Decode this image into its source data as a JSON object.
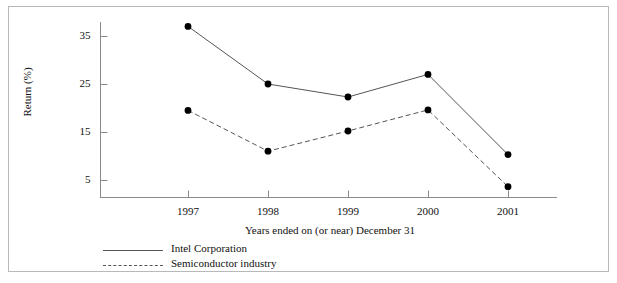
{
  "chart_data": {
    "type": "line",
    "title": "",
    "subtitle": "",
    "xlabel": "Years ended on (or near) December 31",
    "ylabel": "Return (%)",
    "categories": [
      "1997",
      "1998",
      "1999",
      "2000",
      "2001"
    ],
    "xtick_labels": [
      "1997",
      "1998",
      "1999",
      "2000",
      "2001"
    ],
    "ytick_labels": [
      "5",
      "15",
      "25",
      "35"
    ],
    "yticks": [
      5,
      15,
      25,
      35
    ],
    "ylim": [
      0,
      39
    ],
    "grid": false,
    "legend_position": "below-axis-left",
    "series": [
      {
        "name": "Intel Corporation",
        "style": "solid",
        "color": "#555555",
        "marker": "filled-circle",
        "values": [
          37.0,
          25.0,
          22.3,
          27.0,
          10.3
        ]
      },
      {
        "name": "Semiconductor industry",
        "style": "dashed",
        "color": "#555555",
        "marker": "filled-circle",
        "values": [
          19.5,
          11.0,
          15.2,
          19.6,
          3.6
        ]
      }
    ]
  },
  "legend": {
    "items": [
      {
        "label": "Intel Corporation",
        "style": "solid"
      },
      {
        "label": "Semiconductor industry",
        "style": "dashed"
      }
    ]
  },
  "axes": {
    "y_title": "Return (%)",
    "x_title": "Years ended on (or near) December 31"
  },
  "colors": {
    "line": "#555555",
    "marker": "#000000",
    "axis": "#8a8a8a",
    "frame": "#b9b9b9",
    "text": "#111111"
  }
}
